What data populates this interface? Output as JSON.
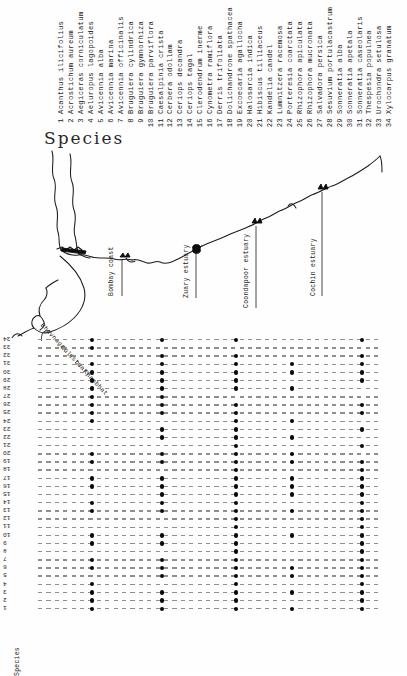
{
  "figure": {
    "species_heading": "Species",
    "matrix_axis_label": "Species"
  },
  "species_list": [
    {
      "num": "1",
      "name": "Acanthus ilicifolius"
    },
    {
      "num": "2",
      "name": "Acrostichum aureum"
    },
    {
      "num": "3",
      "name": "Aegiceras corniculatum"
    },
    {
      "num": "4",
      "name": "Aeluropus lagopoides"
    },
    {
      "num": "5",
      "name": "Avicennia alba"
    },
    {
      "num": "6",
      "name": "Avicennia marina"
    },
    {
      "num": "7",
      "name": "Avicennia officinalis"
    },
    {
      "num": "8",
      "name": "Bruguiera cylindrica"
    },
    {
      "num": "9",
      "name": "Bruguiera gymnorhiza"
    },
    {
      "num": "10",
      "name": "Bruguiera parviflora"
    },
    {
      "num": "11",
      "name": "Caesalpinia crista"
    },
    {
      "num": "12",
      "name": "Cerbera odollam"
    },
    {
      "num": "13",
      "name": "Ceriops decandra"
    },
    {
      "num": "14",
      "name": "Ceriops tagal"
    },
    {
      "num": "15",
      "name": "Clerodendrum inerme"
    },
    {
      "num": "16",
      "name": "Cynometra ramiflora"
    },
    {
      "num": "17",
      "name": "Derris trifoliata"
    },
    {
      "num": "18",
      "name": "Dolichandrone spathacea"
    },
    {
      "num": "19",
      "name": "Excoecaria agallocha"
    },
    {
      "num": "20",
      "name": "Halosarcia indica"
    },
    {
      "num": "21",
      "name": "Hibiscus tilliaceus"
    },
    {
      "num": "22",
      "name": "Kandelia candel"
    },
    {
      "num": "23",
      "name": "Lumnitzera racemosa"
    },
    {
      "num": "24",
      "name": "Porteresia coarctata"
    },
    {
      "num": "25",
      "name": "Rhizophora apiculata"
    },
    {
      "num": "26",
      "name": "Rhizophora mucronata"
    },
    {
      "num": "27",
      "name": "Salvadora persica"
    },
    {
      "num": "28",
      "name": "Sesuvium portulacastrum"
    },
    {
      "num": "29",
      "name": "Sonneratia alba"
    },
    {
      "num": "30",
      "name": "Sonneratia apetala"
    },
    {
      "num": "31",
      "name": "Sonneratia caseolaris"
    },
    {
      "num": "32",
      "name": "Thespesia populnea"
    },
    {
      "num": "33",
      "name": "Urochondra setulosa"
    },
    {
      "num": "34",
      "name": "Xylocarpus granatum"
    }
  ],
  "map": {
    "labels": [
      {
        "text": "Bhavnagar estuary",
        "x": 44,
        "y": 176,
        "rotate": 47
      },
      {
        "text": "Gulf of Khambhat",
        "x": 64,
        "y": 198,
        "rotate": 47
      },
      {
        "text": "Bombay coast",
        "x": 108,
        "y": 150,
        "rotate": -90
      },
      {
        "text": "Zuary estuary",
        "x": 183,
        "y": 152,
        "rotate": -90
      },
      {
        "text": "Coondapoor estuary",
        "x": 243,
        "y": 162,
        "rotate": -90
      },
      {
        "text": "Cochin estuary",
        "x": 310,
        "y": 150,
        "rotate": -90
      }
    ]
  },
  "chart_data": {
    "type": "heatmap",
    "xlabel": "",
    "ylabel": "Species",
    "grid": true,
    "legend": "none",
    "categories": [
      "Bhavnagar estuary",
      "Bombay coast",
      "Zuary estuary",
      "Coondapoor estuary",
      "Cochin estuary"
    ],
    "category_x": [
      70,
      140,
      214,
      270,
      340
    ],
    "row_numbers": [
      "34",
      "33",
      "32",
      "31",
      "30",
      "29",
      "28",
      "27",
      "26",
      "25",
      "24",
      "23",
      "22",
      "21",
      "20",
      "19",
      "18",
      "17",
      "16",
      "15",
      "14",
      "13",
      "12",
      "11",
      "10",
      "9",
      "8",
      "7",
      "6",
      "5",
      "4",
      "3",
      "2",
      "1"
    ],
    "matrix_note": "rows are species numbers 34 (top) down to 1 (bottom); 1 = present (filled dot), 0 = absent",
    "series": [
      {
        "name": "34",
        "values": [
          1,
          1,
          1,
          0,
          1
        ]
      },
      {
        "name": "33",
        "values": [
          1,
          0,
          0,
          0,
          0
        ]
      },
      {
        "name": "32",
        "values": [
          0,
          1,
          1,
          0,
          1
        ]
      },
      {
        "name": "31",
        "values": [
          1,
          1,
          1,
          1,
          1
        ]
      },
      {
        "name": "30",
        "values": [
          1,
          1,
          1,
          1,
          1
        ]
      },
      {
        "name": "29",
        "values": [
          1,
          1,
          1,
          0,
          1
        ]
      },
      {
        "name": "28",
        "values": [
          1,
          1,
          1,
          1,
          0
        ]
      },
      {
        "name": "27",
        "values": [
          1,
          1,
          0,
          0,
          0
        ]
      },
      {
        "name": "26",
        "values": [
          1,
          1,
          1,
          0,
          1
        ]
      },
      {
        "name": "25",
        "values": [
          1,
          1,
          1,
          0,
          1
        ]
      },
      {
        "name": "24",
        "values": [
          1,
          0,
          1,
          1,
          0
        ]
      },
      {
        "name": "23",
        "values": [
          0,
          1,
          1,
          0,
          1
        ]
      },
      {
        "name": "22",
        "values": [
          0,
          1,
          1,
          1,
          0
        ]
      },
      {
        "name": "21",
        "values": [
          0,
          0,
          1,
          0,
          1
        ]
      },
      {
        "name": "20",
        "values": [
          1,
          1,
          1,
          1,
          0
        ]
      },
      {
        "name": "19",
        "values": [
          1,
          1,
          1,
          1,
          1
        ]
      },
      {
        "name": "18",
        "values": [
          0,
          0,
          1,
          0,
          1
        ]
      },
      {
        "name": "17",
        "values": [
          1,
          1,
          1,
          1,
          1
        ]
      },
      {
        "name": "16",
        "values": [
          1,
          1,
          1,
          1,
          1
        ]
      },
      {
        "name": "15",
        "values": [
          0,
          1,
          1,
          1,
          1
        ]
      },
      {
        "name": "14",
        "values": [
          1,
          1,
          1,
          0,
          1
        ]
      },
      {
        "name": "13",
        "values": [
          1,
          1,
          1,
          1,
          1
        ]
      },
      {
        "name": "12",
        "values": [
          0,
          0,
          1,
          0,
          1
        ]
      },
      {
        "name": "11",
        "values": [
          0,
          0,
          1,
          0,
          1
        ]
      },
      {
        "name": "10",
        "values": [
          1,
          1,
          1,
          1,
          1
        ]
      },
      {
        "name": "9",
        "values": [
          1,
          1,
          1,
          0,
          1
        ]
      },
      {
        "name": "8",
        "values": [
          0,
          0,
          1,
          0,
          1
        ]
      },
      {
        "name": "7",
        "values": [
          1,
          1,
          1,
          0,
          1
        ]
      },
      {
        "name": "6",
        "values": [
          1,
          1,
          1,
          1,
          1
        ]
      },
      {
        "name": "5",
        "values": [
          0,
          1,
          1,
          1,
          1
        ]
      },
      {
        "name": "4",
        "values": [
          1,
          0,
          1,
          0,
          1
        ]
      },
      {
        "name": "3",
        "values": [
          1,
          1,
          1,
          1,
          1
        ]
      },
      {
        "name": "2",
        "values": [
          1,
          1,
          1,
          0,
          1
        ]
      },
      {
        "name": "1",
        "values": [
          1,
          1,
          1,
          1,
          1
        ]
      }
    ]
  }
}
